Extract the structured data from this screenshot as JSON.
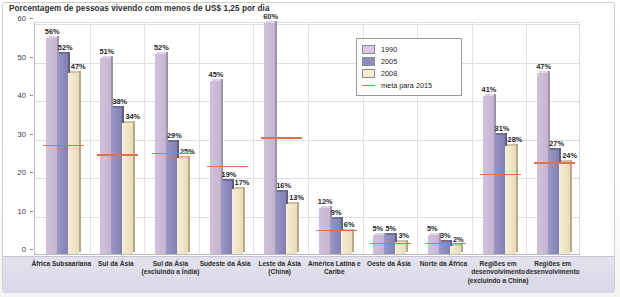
{
  "chart_data": {
    "type": "bar",
    "title": "Porcentagem de pessoas vivendo com menos de US$ 1,25 por dia",
    "xlabel": "",
    "ylabel": "",
    "ylim": [
      0,
      60
    ],
    "yticks": [
      0,
      10,
      20,
      30,
      40,
      50,
      60
    ],
    "grid": true,
    "legend_position": "upper-center-right",
    "value_suffix": "%",
    "categories": [
      "África Subsaariana",
      "Sul da Ásia",
      "Sul da Ásia (excluindo a Índia)",
      "Sudeste da Ásia",
      "Leste da Ásia (China)",
      "América Latina e Caribe",
      "Oeste da Ásia",
      "Norte da África",
      "Regiões em desenvolvimento (excluindo a China)",
      "Regiões em desenvolvimento"
    ],
    "series": [
      {
        "name": "1990",
        "color": "#cdbdd8",
        "values": [
          56,
          51,
          52,
          45,
          60,
          12,
          5,
          5,
          41,
          47
        ]
      },
      {
        "name": "2005",
        "color": "#8e8dbe",
        "values": [
          52,
          38,
          29,
          19,
          16,
          9,
          5,
          3,
          31,
          27
        ]
      },
      {
        "name": "2008",
        "color": "#f1e6c8",
        "values": [
          47,
          34,
          25,
          17,
          13,
          6,
          3,
          2,
          28,
          24
        ]
      }
    ],
    "target_series": {
      "name": "meta para 2015",
      "color": "#e0704e",
      "values": [
        28,
        25.5,
        26,
        22.5,
        30,
        6,
        2.5,
        2.5,
        20.5,
        23.5
      ]
    },
    "data_labels": [
      [
        "56%",
        "52%",
        "47%"
      ],
      [
        "51%",
        "38%",
        "34%"
      ],
      [
        "52%",
        "29%",
        "25%"
      ],
      [
        "45%",
        "19%",
        "17%"
      ],
      [
        "60%",
        "16%",
        "13%"
      ],
      [
        "12%",
        "9%",
        "6%"
      ],
      [
        "5%",
        "5%",
        "3%"
      ],
      [
        "5%",
        "3%",
        "2%"
      ],
      [
        "41%",
        "31%",
        "28%"
      ],
      [
        "47%",
        "27%",
        "24%"
      ]
    ]
  },
  "legend": {
    "items": [
      {
        "label": "1990",
        "type": "swatch"
      },
      {
        "label": "2005",
        "type": "swatch"
      },
      {
        "label": "2008",
        "type": "swatch"
      },
      {
        "label": "meta para 2015",
        "type": "line"
      }
    ]
  }
}
